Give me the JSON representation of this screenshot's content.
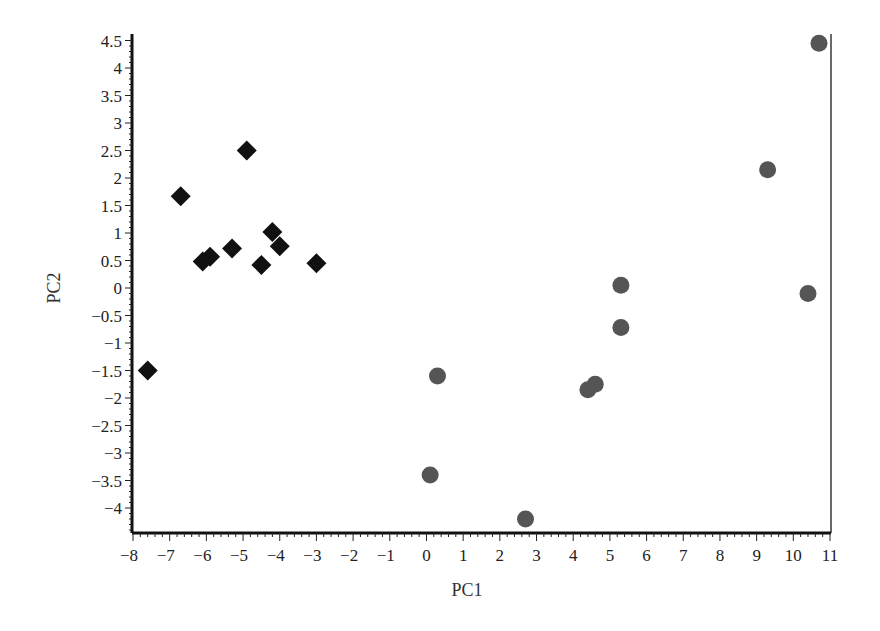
{
  "chart_data": {
    "type": "scatter",
    "title": "",
    "xlabel": "PC1",
    "ylabel": "PC2",
    "xlim": [
      -8,
      11
    ],
    "ylim": [
      -4.4,
      4.5
    ],
    "x_ticks": [
      -8,
      -7,
      -6,
      -5,
      -4,
      -3,
      -2,
      -1,
      0,
      1,
      2,
      3,
      4,
      5,
      6,
      7,
      8,
      9,
      10,
      11
    ],
    "y_ticks": [
      4.5,
      4,
      3.5,
      3,
      2.5,
      2,
      1.5,
      1,
      0.5,
      0,
      -0.5,
      -1,
      -1.5,
      -2,
      -2.5,
      -3,
      -3.5,
      -4
    ],
    "grid": false,
    "legend": null,
    "series": [
      {
        "name": "group-diamond",
        "marker": "diamond",
        "color": "#111111",
        "points": [
          {
            "x": -7.6,
            "y": -1.5
          },
          {
            "x": -6.7,
            "y": 1.67
          },
          {
            "x": -4.9,
            "y": 2.5
          },
          {
            "x": -6.1,
            "y": 0.48
          },
          {
            "x": -5.9,
            "y": 0.57
          },
          {
            "x": -5.3,
            "y": 0.72
          },
          {
            "x": -4.5,
            "y": 0.42
          },
          {
            "x": -4.2,
            "y": 1.02
          },
          {
            "x": -4.0,
            "y": 0.76
          },
          {
            "x": -3.0,
            "y": 0.45
          }
        ]
      },
      {
        "name": "group-circle",
        "marker": "circle",
        "color": "#555555",
        "points": [
          {
            "x": 10.7,
            "y": 4.45
          },
          {
            "x": 9.3,
            "y": 2.15
          },
          {
            "x": 10.4,
            "y": -0.1
          },
          {
            "x": 5.3,
            "y": 0.05
          },
          {
            "x": 5.3,
            "y": -0.72
          },
          {
            "x": 0.3,
            "y": -1.6
          },
          {
            "x": 4.6,
            "y": -1.75
          },
          {
            "x": 4.4,
            "y": -1.85
          },
          {
            "x": 0.1,
            "y": -3.4
          },
          {
            "x": 2.7,
            "y": -4.2
          }
        ]
      }
    ]
  }
}
